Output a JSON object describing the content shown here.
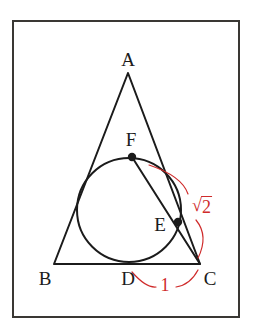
{
  "figure": {
    "title_visible": false,
    "frame": {
      "x": 12,
      "y": 20,
      "width": 228,
      "height": 298,
      "stroke_color": "#3a3834",
      "stroke_width": 2
    },
    "colors": {
      "ink": "#1b1b1b",
      "measurement_red": "#cf2b2b",
      "background": "#ffffff",
      "frame": "#3a3834"
    },
    "triangle": {
      "name": "triangle-abc",
      "vertices": [
        {
          "label": "A",
          "x": 128,
          "y": 73
        },
        {
          "label": "B",
          "x": 54,
          "y": 264
        },
        {
          "label": "C",
          "x": 200,
          "y": 264
        }
      ],
      "stroke_color": "#1b1b1b",
      "stroke_width": 2
    },
    "incircle": {
      "name": "inscribed-circle",
      "cx": 129,
      "cy": 210,
      "r": 52,
      "stroke_color": "#1b1b1b",
      "stroke_width": 2
    },
    "chord": {
      "name": "chord-f-to-c",
      "from": "F",
      "to": "C",
      "x1": 132,
      "y1": 157,
      "x2": 200,
      "y2": 264,
      "stroke_color": "#1b1b1b",
      "stroke_width": 2
    },
    "points": [
      {
        "label": "F",
        "dot": true,
        "x": 132,
        "y": 157,
        "label_x": 131,
        "label_y": 139
      },
      {
        "label": "E",
        "dot": true,
        "x": 178,
        "y": 222,
        "label_x": 160,
        "label_y": 224
      },
      {
        "label": "D",
        "dot": false,
        "x": 129,
        "y": 262,
        "label_x": 128,
        "label_y": 278
      },
      {
        "label": "A",
        "dot": false,
        "x": 128,
        "y": 73,
        "label_x": 128,
        "label_y": 59
      },
      {
        "label": "B",
        "dot": false,
        "x": 54,
        "y": 264,
        "label_x": 45,
        "label_y": 278
      },
      {
        "label": "C",
        "dot": false,
        "x": 200,
        "y": 264,
        "label_x": 210,
        "label_y": 278
      }
    ],
    "measurements": [
      {
        "name": "measure-dc",
        "text": "1",
        "value": 1,
        "segment": "DC",
        "label_x": 165,
        "label_y": 285,
        "color": "#cf2b2b",
        "arc_left": "M 132 272 Q 146 288 156 287",
        "arc_right": "M 176 287 Q 190 285 198 270"
      },
      {
        "name": "measure-fc",
        "text": "√2",
        "radical_symbol": "√",
        "radicand": "2",
        "value_label": "sqrt(2)",
        "segment": "FC",
        "label_x": 202,
        "label_y": 206,
        "color": "#cf2b2b",
        "arc_upper": "M 149 165 Q 182 176 188 194",
        "arc_lower": "M 196 220 Q 208 236 198 258"
      }
    ]
  }
}
